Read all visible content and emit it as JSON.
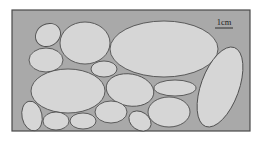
{
  "diagram": {
    "type": "packed-ellipses-micrograph",
    "frame": {
      "x": 12,
      "y": 10,
      "width": 238,
      "height": 121,
      "fill": "#a9a9a9",
      "stroke": "#4a4a4a"
    },
    "ellipse_style": {
      "fill": "#d6d6d6",
      "stroke": "#505050"
    },
    "scale_bar": {
      "label": "1cm",
      "x1": 215,
      "x2": 233,
      "y": 28,
      "label_x": 224,
      "label_y": 25
    },
    "ellipses": [
      {
        "id": "e1",
        "cx": 48,
        "cy": 35,
        "rx": 13,
        "ry": 11,
        "rot": -30
      },
      {
        "id": "e2",
        "cx": 85,
        "cy": 43,
        "rx": 25,
        "ry": 21,
        "rot": 0
      },
      {
        "id": "e3",
        "cx": 164,
        "cy": 49,
        "rx": 54,
        "ry": 28,
        "rot": 0
      },
      {
        "id": "e4",
        "cx": 46,
        "cy": 60,
        "rx": 17,
        "ry": 12,
        "rot": 0
      },
      {
        "id": "e5",
        "cx": 104,
        "cy": 69,
        "rx": 13,
        "ry": 8,
        "rot": 0
      },
      {
        "id": "e6",
        "cx": 68,
        "cy": 91,
        "rx": 37,
        "ry": 22,
        "rot": 0
      },
      {
        "id": "e7",
        "cx": 130,
        "cy": 90,
        "rx": 24,
        "ry": 16,
        "rot": 10
      },
      {
        "id": "e8",
        "cx": 175,
        "cy": 88,
        "rx": 21,
        "ry": 8,
        "rot": 0
      },
      {
        "id": "e9",
        "cx": 220,
        "cy": 87,
        "rx": 19,
        "ry": 42,
        "rot": 20
      },
      {
        "id": "e10",
        "cx": 32,
        "cy": 116,
        "rx": 10,
        "ry": 15,
        "rot": -12
      },
      {
        "id": "e11",
        "cx": 56,
        "cy": 121,
        "rx": 13,
        "ry": 9,
        "rot": 0
      },
      {
        "id": "e12",
        "cx": 83,
        "cy": 121,
        "rx": 13,
        "ry": 8,
        "rot": 0
      },
      {
        "id": "e13",
        "cx": 111,
        "cy": 112,
        "rx": 16,
        "ry": 11,
        "rot": 0
      },
      {
        "id": "e14",
        "cx": 140,
        "cy": 121,
        "rx": 12,
        "ry": 9,
        "rot": 35
      },
      {
        "id": "e15",
        "cx": 169,
        "cy": 112,
        "rx": 21,
        "ry": 15,
        "rot": 0
      }
    ]
  }
}
